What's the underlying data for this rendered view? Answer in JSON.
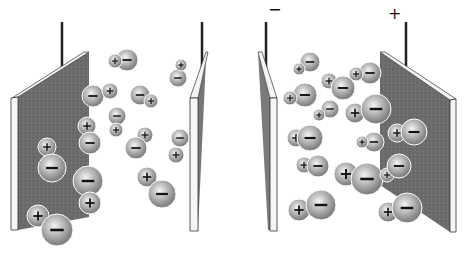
{
  "figure": {
    "colors": {
      "plate_face": "#6e6e6e",
      "plate_edge": "#f4f4f4",
      "wire": "#222222",
      "ion": "#8a8a8a",
      "ion_highlight": "#f2f2f2"
    },
    "right_panel": {
      "negative_terminal_label": "−",
      "positive_terminal_label": "+"
    },
    "left_panel_ions": [
      {
        "plus": [
          115,
          61,
          7
        ],
        "minus": [
          127,
          60,
          11
        ],
        "plus_front": true
      },
      {
        "plus": [
          110,
          91,
          8
        ],
        "minus": [
          93,
          96,
          11
        ],
        "plus_front": true
      },
      {
        "plus": [
          151,
          101,
          7
        ],
        "minus": [
          140,
          95,
          10
        ],
        "plus_front": true
      },
      {
        "plus": [
          181,
          65,
          6
        ],
        "minus": [
          178,
          78,
          9
        ],
        "plus_front": true
      },
      {
        "plus": [
          116,
          130,
          7
        ],
        "minus": [
          117,
          116,
          9
        ],
        "plus_front": true
      },
      {
        "plus": [
          87,
          126,
          9
        ],
        "minus": [
          90,
          143,
          11
        ],
        "plus_front": false
      },
      {
        "plus": [
          145,
          135,
          8
        ],
        "minus": [
          136,
          148,
          11
        ],
        "plus_front": false
      },
      {
        "plus": [
          176,
          155,
          8
        ],
        "minus": [
          180,
          138,
          9
        ],
        "plus_front": true
      },
      {
        "plus": [
          47,
          147,
          9
        ],
        "minus": [
          52,
          168,
          14
        ],
        "plus_front": false
      },
      {
        "plus": [
          90,
          203,
          11
        ],
        "minus": [
          88,
          181,
          15
        ],
        "plus_front": true
      },
      {
        "plus": [
          147,
          177,
          10
        ],
        "minus": [
          162,
          194,
          14
        ],
        "plus_front": false
      },
      {
        "plus": [
          38,
          216,
          11
        ],
        "minus": [
          57,
          230,
          16
        ],
        "plus_front": false
      }
    ],
    "right_panel_ions": [
      {
        "plus": [
          299,
          69,
          6
        ],
        "minus": [
          310,
          62,
          10
        ],
        "plus_front": true
      },
      {
        "plus": [
          329,
          81,
          8
        ],
        "minus": [
          343,
          88,
          12
        ],
        "plus_front": false
      },
      {
        "plus": [
          290,
          98,
          7
        ],
        "minus": [
          305,
          95,
          12
        ],
        "plus_front": true
      },
      {
        "plus": [
          356,
          74,
          7
        ],
        "minus": [
          370,
          73,
          11
        ],
        "plus_front": true
      },
      {
        "plus": [
          319,
          115,
          6
        ],
        "minus": [
          330,
          109,
          9
        ],
        "plus_front": true
      },
      {
        "plus": [
          355,
          113,
          10
        ],
        "minus": [
          376,
          109,
          15
        ],
        "plus_front": false
      },
      {
        "plus": [
          296,
          138,
          9
        ],
        "minus": [
          310,
          138,
          13
        ],
        "plus_front": false
      },
      {
        "plus": [
          362,
          142,
          6
        ],
        "minus": [
          374,
          142,
          10
        ],
        "plus_front": true
      },
      {
        "plus": [
          397,
          133,
          9
        ],
        "minus": [
          414,
          132,
          13
        ],
        "plus_front": false
      },
      {
        "plus": [
          304,
          165,
          8
        ],
        "minus": [
          318,
          166,
          11
        ],
        "plus_front": false
      },
      {
        "plus": [
          346,
          174,
          12
        ],
        "minus": [
          367,
          179,
          16
        ],
        "plus_front": false
      },
      {
        "plus": [
          387,
          175,
          7
        ],
        "minus": [
          399,
          166,
          12
        ],
        "plus_front": false
      },
      {
        "plus": [
          299,
          210,
          11
        ],
        "minus": [
          321,
          205,
          15
        ],
        "plus_front": false
      },
      {
        "plus": [
          388,
          212,
          10
        ],
        "minus": [
          407,
          208,
          15
        ],
        "plus_front": false
      }
    ]
  }
}
